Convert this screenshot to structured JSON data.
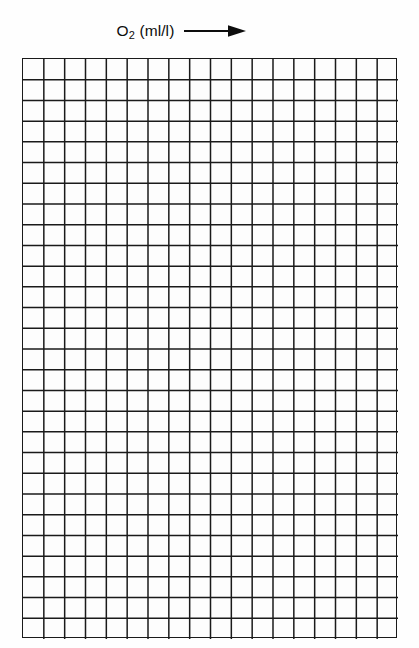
{
  "page": {
    "background_color": "#fefefe",
    "width": 419,
    "height": 648
  },
  "header": {
    "axis_caption_label": "O",
    "axis_caption_subscript": "2",
    "axis_caption_unit": " (ml/l)",
    "arrow_icon": "right-arrow-icon",
    "arrow_direction": "right"
  },
  "chart_data": {
    "type": "table",
    "title": "O2 (ml/l)",
    "subtitle": "",
    "xlabel": "O2 (ml/l)",
    "ylabel": "",
    "grid": true,
    "legend": [],
    "annotations": [],
    "categories": [],
    "values": [],
    "series": [],
    "xlim": [
      0,
      18
    ],
    "ylim": [
      0,
      28
    ],
    "tick_labels_x": [],
    "tick_labels_y": [],
    "grid_columns": 18,
    "grid_rows": 28,
    "cell_width_px": 20.8,
    "cell_height_px": 20.7,
    "grid_line_color": "#1a1a1a",
    "grid_line_width": 1.5,
    "border_color": "#1a1a1a",
    "plot_background": "#fdfdfd"
  }
}
